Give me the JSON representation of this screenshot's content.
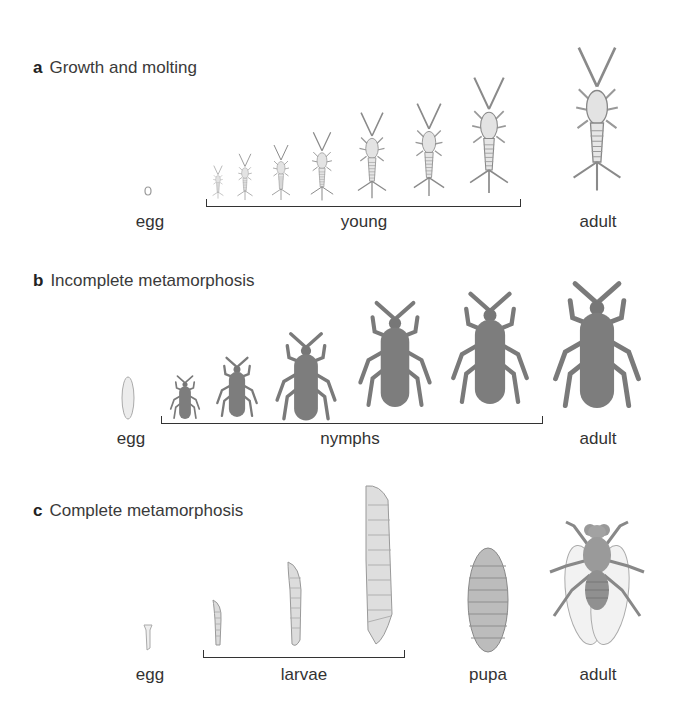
{
  "panels": [
    {
      "letter": "a",
      "title": "Growth and molting",
      "stages": {
        "egg": "egg",
        "young": "young",
        "adult": "adult"
      }
    },
    {
      "letter": "b",
      "title": "Incomplete metamorphosis",
      "stages": {
        "egg": "egg",
        "nymphs": "nymphs",
        "adult": "adult"
      }
    },
    {
      "letter": "c",
      "title": "Complete metamorphosis",
      "stages": {
        "egg": "egg",
        "larvae": "larvae",
        "pupa": "pupa",
        "adult": "adult"
      }
    }
  ],
  "colors": {
    "silverfish": "#d9d9d9",
    "bug_body": "#7d7d7d",
    "larva": "#d8d8d8",
    "pupa": "#b8b8b8",
    "fly": "#9a9a9a",
    "bracket": "#333333"
  }
}
